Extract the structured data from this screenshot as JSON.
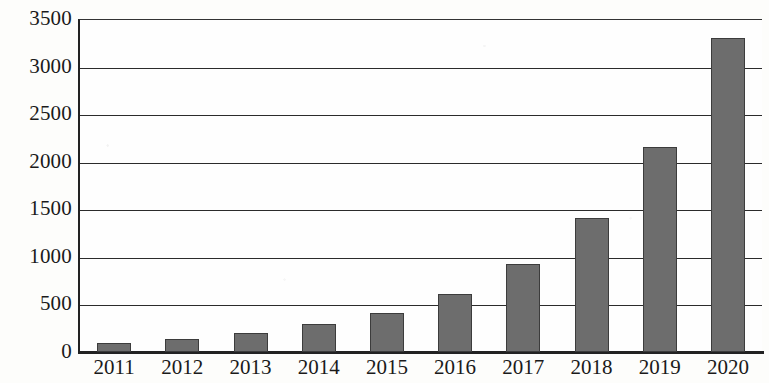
{
  "chart_data": {
    "type": "bar",
    "title": "",
    "subtitle": "",
    "xlabel": "",
    "ylabel": "",
    "categories": [
      "2011",
      "2012",
      "2013",
      "2014",
      "2015",
      "2016",
      "2017",
      "2018",
      "2019",
      "2020"
    ],
    "values": [
      100,
      140,
      200,
      290,
      410,
      610,
      930,
      1410,
      2160,
      3300
    ],
    "series": [
      {
        "name": "",
        "values": [
          100,
          140,
          200,
          290,
          410,
          610,
          930,
          1410,
          2160,
          3300
        ]
      }
    ],
    "ylim": [
      0,
      3500
    ],
    "ytick_labels": [
      "3500",
      "3000",
      "2500",
      "2000",
      "1500",
      "1000",
      "500",
      "0"
    ],
    "ytick_values": [
      3500,
      3000,
      2500,
      2000,
      1500,
      1000,
      500,
      0
    ],
    "grid": true,
    "grid_axis": "y",
    "legend": false,
    "legend_position": "none",
    "bar_color": "#6d6d6d",
    "bar_edge_color": "#3c3c3c",
    "axis_color": "#222222",
    "grid_color": "#2b2b2b",
    "background_color": "#fefefe"
  }
}
